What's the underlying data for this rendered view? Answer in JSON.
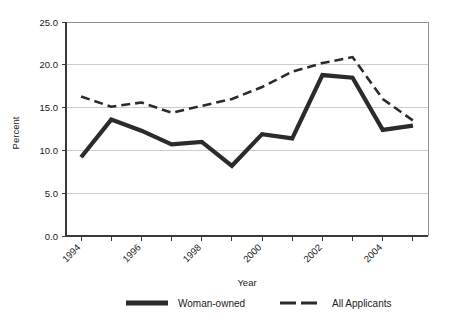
{
  "chart_data": {
    "type": "line",
    "title": "",
    "xlabel": "Year",
    "ylabel": "Percent",
    "ylim": [
      0.0,
      25.0
    ],
    "xlim": [
      1994,
      2005
    ],
    "grid": true,
    "legend_position": "bottom",
    "y_ticks": [
      "0.0",
      "5.0",
      "10.0",
      "15.0",
      "20.0",
      "25.0"
    ],
    "y_tick_values": [
      0.0,
      5.0,
      10.0,
      15.0,
      20.0,
      25.0
    ],
    "x_tick_labels": [
      "1994",
      "",
      "1996",
      "",
      "1998",
      "",
      "2000",
      "",
      "2002",
      "",
      "2004",
      ""
    ],
    "x": [
      1994,
      1995,
      1996,
      1997,
      1998,
      1999,
      2000,
      2001,
      2002,
      2003,
      2004,
      2005
    ],
    "series": [
      {
        "name": "Woman-owned",
        "style": "solid",
        "values": [
          9.2,
          13.6,
          12.3,
          10.7,
          11.0,
          8.2,
          11.9,
          11.4,
          18.8,
          18.5,
          12.4,
          12.9
        ]
      },
      {
        "name": "All Applicants",
        "style": "dashed",
        "values": [
          16.3,
          15.1,
          15.6,
          14.4,
          15.2,
          16.0,
          17.4,
          19.2,
          20.2,
          20.9,
          16.0,
          13.5
        ]
      }
    ]
  },
  "legend": {
    "items": [
      {
        "label": "Woman-owned",
        "style": "solid"
      },
      {
        "label": "All Applicants",
        "style": "dashed"
      }
    ]
  },
  "axes": {
    "y_title": "Percent",
    "x_title": "Year"
  }
}
